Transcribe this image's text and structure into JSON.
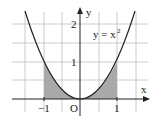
{
  "figure": {
    "curve_label": "y = x",
    "curve_label_sup": "2",
    "x_axis_label": "x",
    "y_axis_label": "y",
    "origin_label": "O",
    "x_ticks": [
      {
        "value": -1,
        "label": "−1"
      },
      {
        "value": 1,
        "label": "1"
      }
    ],
    "y_ticks": [
      {
        "value": 1,
        "label": "1"
      },
      {
        "value": 2,
        "label": "2"
      }
    ],
    "shaded_regions": [
      {
        "from": -1,
        "to": 0,
        "description": "area under y=x^2 from -1 to 0"
      },
      {
        "from": 0,
        "to": 1,
        "description": "area under y=x^2 from 0 to 1"
      }
    ],
    "grid_step": 0.5,
    "colors": {
      "curve": "#222222",
      "shade": "#a9a9a9",
      "grid": "#bdbdbd",
      "axis": "#222222"
    }
  }
}
